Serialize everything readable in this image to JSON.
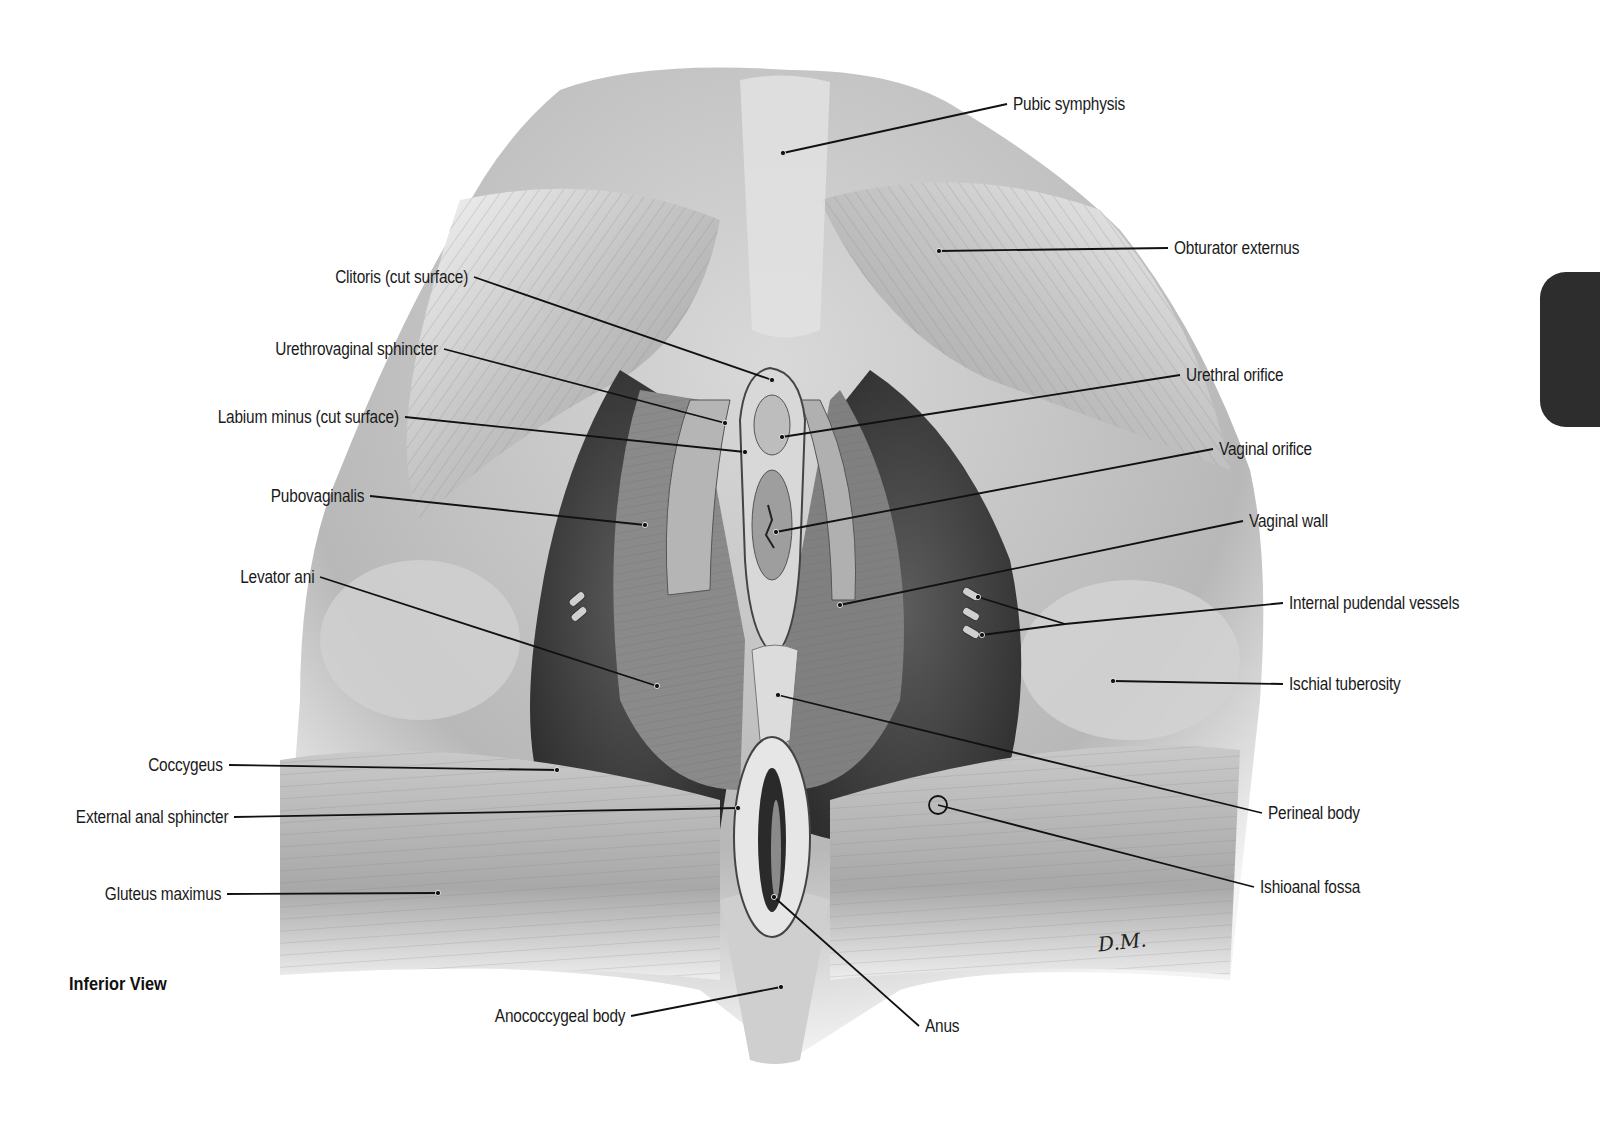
{
  "figure": {
    "view": "Inferior View",
    "signature": "D.M.",
    "colors": {
      "background": "#ffffff",
      "label_text": "#1a1a1a",
      "leader_line": "#111111",
      "edge_tab": "#2d2d2d",
      "muscle_light": "#cfcfcf",
      "muscle_mid": "#9a9a9a",
      "muscle_dark": "#4a4a4a",
      "fossa_dark": "#3a3a3a"
    },
    "labels_left": [
      {
        "text": "Clitoris (cut surface)",
        "x": 472,
        "y": 277,
        "target": [
          772,
          380
        ]
      },
      {
        "text": "Urethrovaginal sphincter",
        "x": 442,
        "y": 349,
        "target": [
          725,
          423
        ]
      },
      {
        "text": "Labium minus (cut surface)",
        "x": 403,
        "y": 417,
        "target": [
          745,
          452
        ]
      },
      {
        "text": "Pubovaginalis",
        "x": 368,
        "y": 496,
        "target": [
          645,
          525
        ]
      },
      {
        "text": "Levator ani",
        "x": 318,
        "y": 577,
        "target": [
          657,
          686
        ]
      },
      {
        "text": "Coccygeus",
        "x": 227,
        "y": 765,
        "target": [
          557,
          770
        ]
      },
      {
        "text": "External anal sphincter",
        "x": 232,
        "y": 817,
        "target": [
          738,
          808
        ]
      },
      {
        "text": "Gluteus maximus",
        "x": 225,
        "y": 894,
        "target": [
          438,
          893
        ]
      },
      {
        "text": "Anococcygeal body",
        "x": 629,
        "y": 1016,
        "target": [
          781,
          987
        ]
      }
    ],
    "labels_right": [
      {
        "text": "Pubic symphysis",
        "x": 1009,
        "y": 104,
        "target": [
          783,
          153
        ]
      },
      {
        "text": "Obturator externus",
        "x": 1170,
        "y": 248,
        "target": [
          939,
          251
        ]
      },
      {
        "text": "Urethral orifice",
        "x": 1182,
        "y": 375,
        "target": [
          782,
          437
        ]
      },
      {
        "text": "Vaginal orifice",
        "x": 1215,
        "y": 449,
        "target": [
          776,
          532
        ]
      },
      {
        "text": "Vaginal wall",
        "x": 1245,
        "y": 521,
        "target": [
          840,
          605
        ]
      },
      {
        "text": "Internal pudendal vessels",
        "x": 1285,
        "y": 603,
        "target": [
          1065,
          624
        ],
        "branches": [
          [
            978,
            597
          ],
          [
            982,
            635
          ]
        ]
      },
      {
        "text": "Ischial tuberosity",
        "x": 1285,
        "y": 684,
        "target": [
          1113,
          681
        ]
      },
      {
        "text": "Perineal body",
        "x": 1264,
        "y": 813,
        "target": [
          778,
          695
        ]
      },
      {
        "text": "Ishioanal fossa",
        "x": 1256,
        "y": 887,
        "target": [
          938,
          805
        ]
      },
      {
        "text": "Anus",
        "x": 921,
        "y": 1026,
        "target": [
          774,
          897
        ]
      }
    ]
  }
}
